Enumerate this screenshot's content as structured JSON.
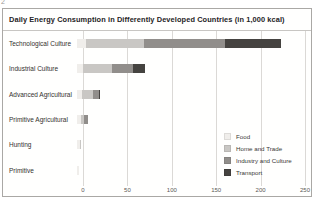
{
  "page": {
    "marker": "2"
  },
  "chart_data": {
    "type": "bar",
    "orientation": "horizontal",
    "stacked": true,
    "title": "Daily Energy Consumption in Differently Developed Countries (in 1,000 kcal)",
    "categories": [
      "Technological Culture",
      "Industrial Culture",
      "Advanced Agricultural",
      "Primitive Agricultural",
      "Hunting",
      "Primitive"
    ],
    "series": [
      {
        "name": "Food",
        "color": "#f0eeeb",
        "values": [
          10,
          7,
          6,
          4,
          3,
          2
        ]
      },
      {
        "name": "Home and Trade",
        "color": "#c9c7c4",
        "values": [
          66,
          32,
          12,
          4,
          2,
          0
        ]
      },
      {
        "name": "Industry and Culture",
        "color": "#918e8b",
        "values": [
          91,
          24,
          7,
          4,
          0,
          0
        ]
      },
      {
        "name": "Transport",
        "color": "#454340",
        "values": [
          63,
          14,
          1,
          0,
          0,
          0
        ]
      }
    ],
    "totals": [
      230,
      77,
      26,
      12,
      5,
      2
    ],
    "xlim": [
      0,
      250
    ],
    "xticks": [
      0,
      50,
      100,
      150,
      200,
      250
    ],
    "xlabel": "",
    "grid": true,
    "legend_position": "inside-lower-right",
    "colors": {
      "gridline": "#dbd9d6",
      "axis_text": "#5a5855",
      "label_text": "#33312e",
      "box_border": "#aaa8a5",
      "title_text": "#25231f"
    }
  }
}
